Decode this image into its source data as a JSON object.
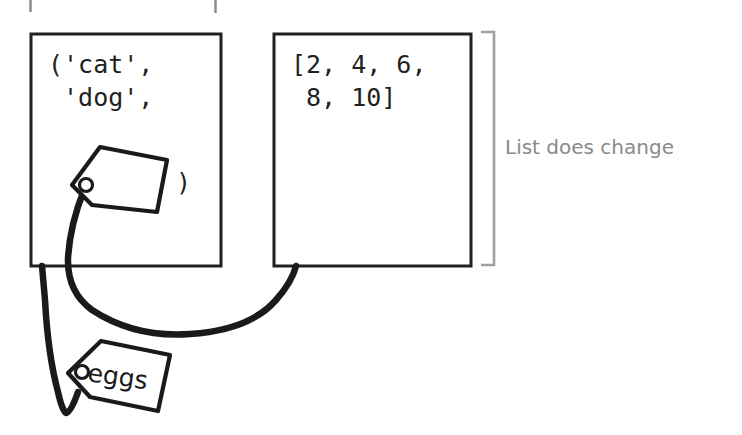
{
  "figure": {
    "background_color": "#ffffff",
    "ink_color": "#231f20",
    "annotation_color": "#8a8a8a"
  },
  "boxes": [
    {
      "id": "tuple-box",
      "name": "tuple-value-box",
      "code": "('cat',\n 'dog',",
      "trailing_paren": ")",
      "x": 31,
      "y": 34,
      "width": 190,
      "height": 232
    },
    {
      "id": "list-box",
      "name": "list-value-box",
      "code": "[2, 4, 6,\n 8, 10]",
      "x": 274,
      "y": 34,
      "width": 197,
      "height": 232
    }
  ],
  "annotations": [
    {
      "id": "list-change",
      "text": "List does change",
      "bracket": "right-curly-span",
      "color": "#8a8a8a"
    }
  ],
  "tags": [
    {
      "id": "blank-tag",
      "label": "",
      "attached_to": "tuple-box"
    },
    {
      "id": "eggs-tag",
      "label": "eggs",
      "attached_to": "list-box"
    }
  ],
  "crop_stubs": [
    {
      "id": "stub-left",
      "x": 30
    },
    {
      "id": "stub-right",
      "x": 215
    }
  ]
}
